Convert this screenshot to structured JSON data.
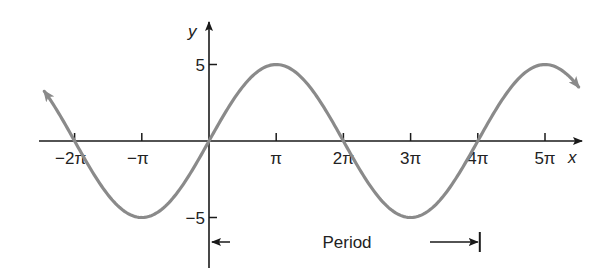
{
  "chart_data": {
    "type": "line",
    "title": "",
    "function": "y = 5 sin(x/2)",
    "amplitude": 5,
    "period_in_pi": 4,
    "xlabel": "x",
    "ylabel": "y",
    "x_ticks": [
      {
        "value_pi": -2,
        "label": "−2π"
      },
      {
        "value_pi": -1,
        "label": "−π"
      },
      {
        "value_pi": 1,
        "label": "π"
      },
      {
        "value_pi": 2,
        "label": "2π"
      },
      {
        "value_pi": 3,
        "label": "3π"
      },
      {
        "value_pi": 4,
        "label": "4π"
      },
      {
        "value_pi": 5,
        "label": "5π"
      }
    ],
    "y_ticks": [
      {
        "value": 5,
        "label": "5"
      },
      {
        "value": -5,
        "label": "−5"
      }
    ],
    "x_range_pi": [
      -2.45,
      5.5
    ],
    "ylim": [
      -5,
      5
    ],
    "key_points": [
      {
        "x": "−2π",
        "y": 0
      },
      {
        "x": "−π",
        "y": -5
      },
      {
        "x": "0",
        "y": 0
      },
      {
        "x": "π",
        "y": 5
      },
      {
        "x": "2π",
        "y": 0
      },
      {
        "x": "3π",
        "y": -5
      },
      {
        "x": "4π",
        "y": 0
      },
      {
        "x": "5π",
        "y": 5
      }
    ],
    "annotation": {
      "label": "Period",
      "from_pi": 0,
      "to_pi": 4
    },
    "grid": false,
    "colors": {
      "curve": "#8a8a8a",
      "axes": "#1a1a1a"
    }
  }
}
